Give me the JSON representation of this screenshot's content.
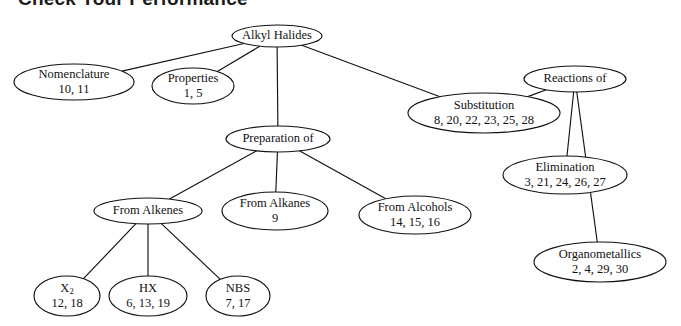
{
  "page": {
    "title": "Check Your Performance",
    "background_color": "#ffffff",
    "ink_color": "#111111"
  },
  "chart_data": {
    "type": "diagram",
    "diagram_kind": "concept-map-tree",
    "title": "Check Your Performance",
    "root": "Alkyl Halides",
    "nodes": [
      {
        "id": "alkyl-halides",
        "label": "Alkyl Halides",
        "numbers": "",
        "cx": 277,
        "cy": 36,
        "rx": 45,
        "ry": 11
      },
      {
        "id": "nomenclature",
        "label": "Nomenclature",
        "numbers": "10, 11",
        "cx": 74,
        "cy": 82,
        "rx": 60,
        "ry": 18
      },
      {
        "id": "properties",
        "label": "Properties",
        "numbers": "1, 5",
        "cx": 193,
        "cy": 86,
        "rx": 41,
        "ry": 18
      },
      {
        "id": "substitution",
        "label": "Substitution",
        "numbers": "8, 20, 22, 23, 25, 28",
        "cx": 484,
        "cy": 113,
        "rx": 76,
        "ry": 20
      },
      {
        "id": "reactions-of",
        "label": "Reactions of",
        "numbers": "",
        "cx": 575,
        "cy": 79,
        "rx": 51,
        "ry": 13
      },
      {
        "id": "preparation-of",
        "label": "Preparation of",
        "numbers": "",
        "cx": 278,
        "cy": 139,
        "rx": 52,
        "ry": 13
      },
      {
        "id": "elimination",
        "label": "Elimination",
        "numbers": "3, 21, 24, 26, 27",
        "cx": 565,
        "cy": 175,
        "rx": 62,
        "ry": 19
      },
      {
        "id": "from-alkenes",
        "label": "From Alkenes",
        "numbers": "",
        "cx": 148,
        "cy": 211,
        "rx": 54,
        "ry": 13
      },
      {
        "id": "from-alkanes",
        "label": "From Alkanes",
        "numbers": "9",
        "cx": 275,
        "cy": 211,
        "rx": 53,
        "ry": 19
      },
      {
        "id": "from-alcohols",
        "label": "From Alcohols",
        "numbers": "14, 15, 16",
        "cx": 415,
        "cy": 215,
        "rx": 56,
        "ry": 19
      },
      {
        "id": "organometallics",
        "label": "Organometallics",
        "numbers": "2, 4, 29, 30",
        "cx": 600,
        "cy": 262,
        "rx": 66,
        "ry": 20
      },
      {
        "id": "x2",
        "label": "X2",
        "numbers": "12, 18",
        "cx": 67,
        "cy": 296,
        "rx": 33,
        "ry": 20,
        "subscript": true
      },
      {
        "id": "hx",
        "label": "HX",
        "numbers": "6, 13, 19",
        "cx": 148,
        "cy": 296,
        "rx": 39,
        "ry": 20
      },
      {
        "id": "nbs",
        "label": "NBS",
        "numbers": "7, 17",
        "cx": 238,
        "cy": 296,
        "rx": 32,
        "ry": 20
      }
    ],
    "edges": [
      {
        "from": "alkyl-halides",
        "to": "nomenclature"
      },
      {
        "from": "alkyl-halides",
        "to": "properties"
      },
      {
        "from": "alkyl-halides",
        "to": "preparation-of"
      },
      {
        "from": "alkyl-halides",
        "to": "substitution"
      },
      {
        "from": "reactions-of",
        "to": "substitution"
      },
      {
        "from": "reactions-of",
        "to": "elimination"
      },
      {
        "from": "reactions-of",
        "to": "organometallics"
      },
      {
        "from": "preparation-of",
        "to": "from-alkenes"
      },
      {
        "from": "preparation-of",
        "to": "from-alkanes"
      },
      {
        "from": "preparation-of",
        "to": "from-alcohols"
      },
      {
        "from": "from-alkenes",
        "to": "x2"
      },
      {
        "from": "from-alkenes",
        "to": "hx"
      },
      {
        "from": "from-alkenes",
        "to": "nbs"
      }
    ]
  }
}
